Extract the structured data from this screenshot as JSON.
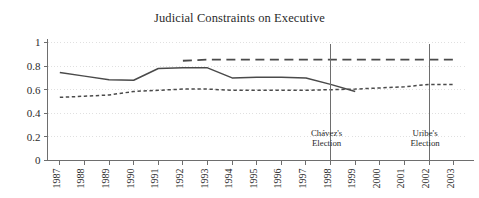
{
  "chart_data": {
    "type": "line",
    "title": "Judicial Constraints on Executive",
    "xlabel": "",
    "ylabel": "",
    "xlim": [
      1986.5,
      2003.5
    ],
    "ylim": [
      0,
      1
    ],
    "grid": true,
    "legend_position": "none",
    "x_tick_labels": [
      "1987",
      "1988",
      "1989",
      "1990",
      "1991",
      "1992",
      "1993",
      "1994",
      "1995",
      "1996",
      "1997",
      "1998",
      "1999",
      "2000",
      "2001",
      "2002",
      "2003"
    ],
    "y_tick_labels": [
      "0",
      "0.2",
      "0.4",
      "0.6",
      "0.8",
      "1"
    ],
    "y_tick_values": [
      0,
      0.2,
      0.4,
      0.6,
      0.8,
      1
    ],
    "series": [
      {
        "name": "solid-series",
        "style": "solid",
        "color": "#4a4a4a",
        "x": [
          1987,
          1988,
          1989,
          1990,
          1991,
          1992,
          1993,
          1994,
          1995,
          1996,
          1997,
          1998,
          1999
        ],
        "values": [
          0.745,
          0.715,
          0.685,
          0.68,
          0.78,
          0.785,
          0.785,
          0.7,
          0.705,
          0.705,
          0.7,
          0.645,
          0.585
        ]
      },
      {
        "name": "long-dash-series",
        "style": "long-dash",
        "color": "#4a4a4a",
        "x": [
          1992,
          1993,
          1994,
          1995,
          1996,
          1997,
          1998,
          1999,
          2000,
          2001,
          2002,
          2003
        ],
        "values": [
          0.845,
          0.855,
          0.855,
          0.855,
          0.855,
          0.855,
          0.855,
          0.855,
          0.855,
          0.855,
          0.855,
          0.855
        ]
      },
      {
        "name": "short-dash-series",
        "style": "short-dash",
        "color": "#4a4a4a",
        "x": [
          1987,
          1988,
          1989,
          1990,
          1991,
          1992,
          1993,
          1994,
          1995,
          1996,
          1997,
          1998,
          1999,
          2000,
          2001,
          2002,
          2003
        ],
        "values": [
          0.535,
          0.545,
          0.555,
          0.585,
          0.595,
          0.605,
          0.605,
          0.595,
          0.595,
          0.595,
          0.595,
          0.6,
          0.605,
          0.615,
          0.625,
          0.645,
          0.645
        ]
      }
    ],
    "annotations": [
      {
        "name": "chavez-election",
        "x": 1998,
        "line_top": 0.985,
        "line_bottom": 0.0,
        "label_line1": "Chávez's",
        "label_line2": "Election"
      },
      {
        "name": "uribe-election",
        "x": 2002,
        "line_top": 0.985,
        "line_bottom": 0.0,
        "label_line1": "Uribe's",
        "label_line2": "Election"
      }
    ]
  },
  "colors": {
    "line": "#4a4a4a",
    "axis": "#6e6e6e",
    "grid": "#d8d8d8",
    "text": "#2b2b2b",
    "background": "#ffffff"
  }
}
